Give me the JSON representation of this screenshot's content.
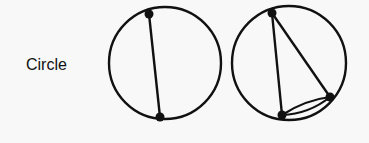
{
  "row_label": "Circle",
  "colors": {
    "background": "#f8f8f8",
    "stroke": "#111111"
  },
  "graphs": [
    {
      "name": "circle-graph-1",
      "circle": {
        "cx": 165,
        "cy": 63,
        "r": 56
      },
      "nodes": [
        {
          "x": 149,
          "y": 14
        },
        {
          "x": 160,
          "y": 117
        }
      ],
      "edges": [
        {
          "from": 0,
          "to": 1,
          "multiplicity": 1
        }
      ]
    },
    {
      "name": "circle-graph-2",
      "circle": {
        "cx": 289,
        "cy": 63,
        "r": 57
      },
      "nodes": [
        {
          "x": 272,
          "y": 13
        },
        {
          "x": 282,
          "y": 115
        },
        {
          "x": 330,
          "y": 97
        }
      ],
      "edges": [
        {
          "from": 0,
          "to": 1,
          "multiplicity": 1
        },
        {
          "from": 0,
          "to": 2,
          "multiplicity": 1
        },
        {
          "from": 1,
          "to": 2,
          "multiplicity": 2
        }
      ]
    }
  ]
}
